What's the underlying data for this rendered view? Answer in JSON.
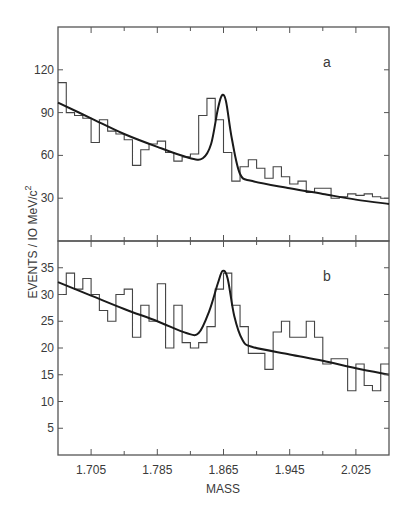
{
  "chart_data": [
    {
      "panel": "a",
      "type": "bar",
      "subtype": "histogram-with-fit",
      "title": "",
      "panel_label": "a",
      "xlabel": "MASS",
      "ylabel": "EVENTS / 10 MeV/c²",
      "xlim": [
        1.665,
        2.065
      ],
      "ylim": [
        0,
        150
      ],
      "bin_width": 0.01,
      "yticks": [
        30,
        60,
        90,
        120
      ],
      "ytick_labels": [
        "30",
        "60",
        "90",
        "120"
      ],
      "xticks": [
        1.705,
        1.785,
        1.865,
        1.945,
        2.025
      ],
      "xtick_labels": [],
      "grid": false,
      "categories": [
        1.665,
        1.675,
        1.685,
        1.695,
        1.705,
        1.715,
        1.725,
        1.735,
        1.745,
        1.755,
        1.765,
        1.775,
        1.785,
        1.795,
        1.805,
        1.815,
        1.825,
        1.835,
        1.845,
        1.855,
        1.865,
        1.875,
        1.885,
        1.895,
        1.905,
        1.915,
        1.925,
        1.935,
        1.945,
        1.955,
        1.965,
        1.975,
        1.985,
        1.995,
        2.005,
        2.015,
        2.025,
        2.035,
        2.045,
        2.055
      ],
      "values": [
        111,
        90,
        88,
        86,
        69,
        85,
        77,
        75,
        71,
        53,
        64,
        68,
        70,
        62,
        56,
        59,
        61,
        88,
        100,
        85,
        62,
        42,
        52,
        57,
        51,
        44,
        52,
        45,
        40,
        42,
        34,
        37,
        37,
        30,
        31,
        33,
        32,
        33,
        31,
        30
      ],
      "fit": {
        "description": "Gaussian peak on smooth falling background",
        "x": [
          1.665,
          1.705,
          1.745,
          1.785,
          1.825,
          1.84,
          1.85,
          1.858,
          1.863,
          1.868,
          1.875,
          1.885,
          1.9,
          1.945,
          1.985,
          2.025,
          2.065
        ],
        "y": [
          97,
          86,
          75,
          66,
          58,
          58,
          68,
          92,
          102,
          98,
          72,
          47,
          42,
          37,
          33,
          29,
          26
        ]
      }
    },
    {
      "panel": "b",
      "type": "bar",
      "subtype": "histogram-with-fit",
      "title": "",
      "panel_label": "b",
      "xlabel": "MASS",
      "ylabel": "EVENTS / 10 MeV/c²",
      "xlim": [
        1.665,
        2.065
      ],
      "ylim": [
        0,
        40
      ],
      "bin_width": 0.01,
      "yticks": [
        5,
        10,
        15,
        20,
        25,
        30,
        35
      ],
      "ytick_labels": [
        "5",
        "10",
        "15",
        "20",
        "25",
        "30",
        "35"
      ],
      "xticks": [
        1.705,
        1.785,
        1.865,
        1.945,
        2.025
      ],
      "xtick_labels": [
        "1.705",
        "1.785",
        "1.865",
        "1.945",
        "2.025"
      ],
      "grid": false,
      "categories": [
        1.665,
        1.675,
        1.685,
        1.695,
        1.705,
        1.715,
        1.725,
        1.735,
        1.745,
        1.755,
        1.765,
        1.775,
        1.785,
        1.795,
        1.805,
        1.815,
        1.825,
        1.835,
        1.845,
        1.855,
        1.865,
        1.875,
        1.885,
        1.895,
        1.905,
        1.915,
        1.925,
        1.935,
        1.945,
        1.955,
        1.965,
        1.975,
        1.985,
        1.995,
        2.005,
        2.015,
        2.025,
        2.035,
        2.045,
        2.055
      ],
      "values": [
        30,
        34,
        31,
        33,
        30,
        27,
        25,
        30,
        31,
        22,
        28,
        25,
        32,
        20,
        28,
        21,
        20,
        21,
        24,
        31,
        34,
        28,
        24,
        19,
        19,
        16,
        23,
        25,
        22,
        22,
        25,
        22,
        17,
        18,
        18,
        12,
        17,
        13,
        12,
        17
      ],
      "fit": {
        "description": "Gaussian peak on smooth falling background",
        "x": [
          1.665,
          1.705,
          1.745,
          1.785,
          1.82,
          1.835,
          1.848,
          1.858,
          1.864,
          1.87,
          1.878,
          1.888,
          1.9,
          1.945,
          1.985,
          2.025,
          2.065
        ],
        "y": [
          32.3,
          29.8,
          27.3,
          25.0,
          22.8,
          22.8,
          27,
          32,
          34.4,
          33,
          26,
          21.5,
          20.2,
          18.8,
          17.6,
          16.2,
          15.0
        ]
      }
    }
  ],
  "figure": {
    "xlabel": "MASS",
    "ylabel": "EVENTS / IO MeV/c",
    "ylabel_superscript": "2",
    "panel_a_label": "a",
    "panel_b_label": "b",
    "panel_a_ytick_labels": [
      "30",
      "60",
      "90",
      "120"
    ],
    "panel_b_ytick_labels": [
      "5",
      "10",
      "15",
      "20",
      "25",
      "30",
      "35"
    ],
    "xtick_labels": [
      "1.705",
      "1.785",
      "1.865",
      "1.945",
      "2.025"
    ],
    "colors": {
      "line": "#1a1a1a",
      "histogram": "#444444",
      "axes": "#555555",
      "background": "#ffffff"
    }
  }
}
